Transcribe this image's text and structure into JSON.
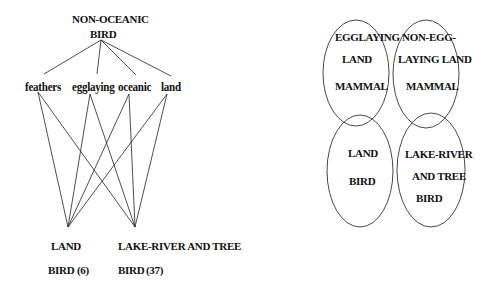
{
  "tree": {
    "root": {
      "line1": "NON-OCEANIC",
      "line2": "BIRD"
    },
    "attributes": [
      {
        "label": "feathers"
      },
      {
        "label": "egglaying"
      },
      {
        "label": "oceanic"
      },
      {
        "label": "land"
      }
    ],
    "leaves": [
      {
        "line1": "LAND",
        "line2": "BIRD",
        "count": "(6)"
      },
      {
        "line1": "LAKE-RIVER AND TREE",
        "line2": "BIRD",
        "count": "(37)"
      }
    ]
  },
  "venn": {
    "ellipses": [
      {
        "lines": [
          "EGGLAYING",
          "LAND",
          "MAMMAL"
        ]
      },
      {
        "lines": [
          "NON-EGG-",
          "LAYING LAND",
          "MAMMAL"
        ]
      },
      {
        "lines": [
          "LAND",
          "BIRD"
        ]
      },
      {
        "lines": [
          "LAKE-RIVER",
          "AND TREE",
          "BIRD"
        ]
      }
    ]
  }
}
